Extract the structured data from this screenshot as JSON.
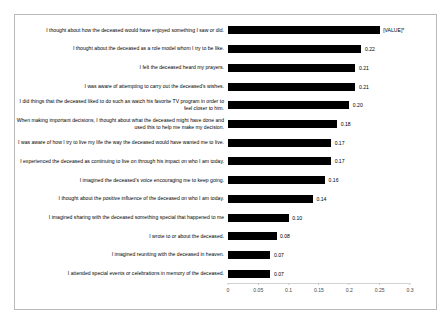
{
  "chart_data": {
    "type": "bar",
    "orientation": "horizontal",
    "title": "",
    "subtitle": "",
    "xlabel": "",
    "ylabel": "",
    "xlim": [
      0,
      0.3
    ],
    "xticks": [
      "0",
      "0.05",
      "0.1",
      "0.15",
      "0.2",
      "0.25",
      "0.3"
    ],
    "xtick_values": [
      0,
      0.05,
      0.1,
      0.15,
      0.2,
      0.25,
      0.3
    ],
    "grid": false,
    "legend": "none",
    "bar_color": "#000000",
    "categories": [
      "I thought about how the deceased would have enjoyed something I saw or did.",
      "I thought about the deceased as a role model whom I try to be like.",
      "I felt the deceased heard my prayers.",
      "I was aware of attempting to carry out the deceased's wishes.",
      "I did things that the deceased liked to do such as watch his favorite TV program in order to feel closer to him.",
      "When making important decisions, I thought about what the deceased might have done and used this to help me make my decision.",
      "I was aware of how I try to live my life the way the deceased would have wanted me to live.",
      "I experienced the deceased as continuing to live on through his impact on who I am today.",
      "I imagined the deceased's voice encouraging me to keep going.",
      "I thought about the positive influence of the deceased on who I am today.",
      "I imagined sharing with the deceased something special that happened to me",
      "I wrote to or about the deceased.",
      "I imagined reuniting with the deceased in heaven.",
      "I attended special events or celebrations in memory of the deceased."
    ],
    "values": [
      0.25,
      0.22,
      0.21,
      0.21,
      0.2,
      0.18,
      0.17,
      0.17,
      0.16,
      0.14,
      0.1,
      0.08,
      0.07,
      0.07
    ],
    "data_labels": [
      "[VALUE]*",
      "0.22",
      "0.21",
      "0.21",
      "0.20",
      "0.18",
      "0.17",
      "0.17",
      "0.16",
      "0.14",
      "0.10",
      "0.08",
      "0.07",
      "0.07"
    ]
  }
}
